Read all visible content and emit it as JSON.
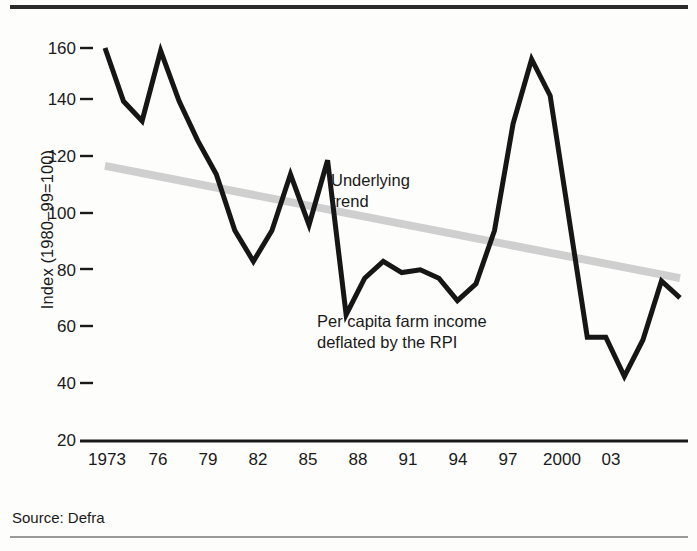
{
  "figure": {
    "source_note": "Source: Defra"
  },
  "chart_data": {
    "type": "line",
    "title": "",
    "xlabel": "",
    "ylabel": "Index (1980–99=100)",
    "ylim": [
      20,
      165
    ],
    "xlim": [
      1973,
      2004
    ],
    "grid": false,
    "legend": "annotations-inline",
    "y_ticks": [
      20,
      40,
      60,
      80,
      100,
      120,
      140,
      160
    ],
    "y_tick_labels": [
      "20",
      "40",
      "60",
      "80",
      "100",
      "120",
      "140",
      "160"
    ],
    "x_ticks": [
      1973,
      1976,
      1979,
      1982,
      1985,
      1988,
      1991,
      1994,
      1997,
      2000,
      2003
    ],
    "x_tick_labels": [
      "1973",
      "76",
      "79",
      "82",
      "85",
      "88",
      "91",
      "94",
      "97",
      "2000",
      "03"
    ],
    "annotations": [
      {
        "name": "trend-label",
        "text": "Underlying\ntrend"
      },
      {
        "name": "series-label",
        "text": "Per capita farm income\ndeflated by the RPI"
      }
    ],
    "series": [
      {
        "name": "Per capita farm income deflated by the RPI",
        "color": "#161616",
        "width": 5,
        "x": [
          1973,
          1974,
          1975,
          1976,
          1977,
          1978,
          1979,
          1980,
          1981,
          1982,
          1983,
          1984,
          1985,
          1986,
          1987,
          1988,
          1989,
          1990,
          1991,
          1992,
          1993,
          1994,
          1995,
          1996,
          1997,
          1998,
          1999,
          2000,
          2001,
          2002,
          2003,
          2004
        ],
        "values": [
          160,
          141,
          134,
          159,
          141,
          127,
          115,
          95,
          84,
          95,
          115,
          97,
          120,
          65,
          78,
          84,
          80,
          81,
          78,
          70,
          76,
          95,
          133,
          156,
          143,
          100,
          57,
          57,
          43,
          56,
          77,
          71
        ]
      },
      {
        "name": "Underlying trend",
        "color": "#cfcfcf",
        "width": 8,
        "x": [
          1973,
          2004
        ],
        "values": [
          118,
          78
        ]
      }
    ]
  }
}
